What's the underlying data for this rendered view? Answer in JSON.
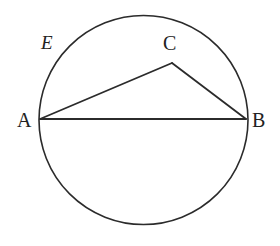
{
  "figure": {
    "name": "circle-with-inscribed-triangle",
    "background_color": "#ffffff",
    "stroke_color": "#2b2b2b",
    "label_color": "#222222"
  },
  "labels": {
    "a": "A",
    "b": "B",
    "c": "C",
    "e": "E"
  },
  "chart_data": {
    "type": "diagram",
    "title": "",
    "shapes": [
      {
        "kind": "circle",
        "name": "main-circle",
        "center": [
          143.5,
          120
        ],
        "radius": 104.5,
        "fill": "none",
        "stroke": "#2b2b2b",
        "stroke_width": 1.6
      },
      {
        "kind": "polyline",
        "name": "triangle-abc",
        "points": [
          [
            40,
            119
          ],
          [
            172,
            63
          ],
          [
            246,
            119
          ]
        ],
        "closed": false,
        "fill": "none",
        "stroke": "#2b2b2b",
        "stroke_width": 1.8
      },
      {
        "kind": "line",
        "name": "chord-ab",
        "from": [
          40,
          119
        ],
        "to": [
          246,
          119
        ],
        "stroke": "#2b2b2b",
        "stroke_width": 1.8
      }
    ],
    "points": [
      {
        "label": "A",
        "x": 40,
        "y": 119,
        "label_pos": [
          25,
          120
        ]
      },
      {
        "label": "B",
        "x": 246,
        "y": 119,
        "label_pos": [
          260,
          120
        ]
      },
      {
        "label": "C",
        "x": 172,
        "y": 63,
        "label_pos": [
          171,
          43
        ]
      },
      {
        "label": "E",
        "x": 70,
        "y": 54,
        "label_pos": [
          49,
          43
        ],
        "style": "italic",
        "note": "arc-region-label"
      }
    ],
    "axis_ranges": {
      "x": [
        0,
        280
      ],
      "y": [
        0,
        246
      ]
    },
    "grid": false,
    "legend": null
  }
}
